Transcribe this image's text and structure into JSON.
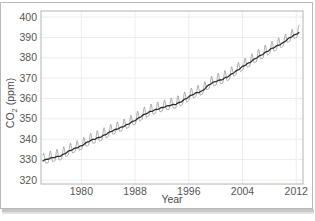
{
  "figure": {
    "background_color": "#ffffff",
    "border_color": "#b9b9b9",
    "plot_border_color": "#b4b4b4",
    "grid_color": "#ededed"
  },
  "chart_data": {
    "type": "line",
    "title": "",
    "xlabel": "Year",
    "ylabel": "CO2 (ppm)",
    "ylabel_main": "CO",
    "ylabel_sub": "2",
    "ylabel_unit": " (ppm)",
    "xlim": [
      1974.0,
      2013.0
    ],
    "ylim": [
      318.0,
      403.0
    ],
    "xticks": [
      1980,
      1988,
      1996,
      2004,
      2012
    ],
    "xtick_labels": [
      "1980",
      "1988",
      "1996",
      "2004",
      "2012"
    ],
    "yticks": [
      320,
      330,
      340,
      350,
      360,
      370,
      380,
      390,
      400
    ],
    "ytick_labels": [
      "320",
      "330",
      "340",
      "350",
      "360",
      "370",
      "380",
      "390",
      "400"
    ],
    "grid": true,
    "legend": "none",
    "series": [
      {
        "name": "Monthly mean CO2",
        "color": "#8c8c8c",
        "linewidth": 0.7,
        "description": "Monthly average atmospheric CO2 at Mauna Loa showing seasonal sawtooth oscillation of about +/- 3.2 ppm superimposed on rising trend",
        "seasonal_amplitude_ppm": 3.2,
        "seasonal_peak_month": 5,
        "seasonal_trough_month": 10
      },
      {
        "name": "Trend (seasonally adjusted)",
        "color": "#2b2b2b",
        "linewidth": 1.3,
        "description": "Smoothed long term trend rising from about 330 ppm in 1975 to about 390 ppm in 2012",
        "annual_anchors": [
          {
            "year": 1974.3,
            "value": 329.6
          },
          {
            "year": 1975.0,
            "value": 330.2
          },
          {
            "year": 1976.0,
            "value": 331.1
          },
          {
            "year": 1977.0,
            "value": 332.0
          },
          {
            "year": 1978.0,
            "value": 333.8
          },
          {
            "year": 1979.0,
            "value": 335.4
          },
          {
            "year": 1980.0,
            "value": 336.8
          },
          {
            "year": 1981.0,
            "value": 338.7
          },
          {
            "year": 1982.0,
            "value": 340.1
          },
          {
            "year": 1983.0,
            "value": 341.4
          },
          {
            "year": 1984.0,
            "value": 343.0
          },
          {
            "year": 1985.0,
            "value": 344.6
          },
          {
            "year": 1986.0,
            "value": 346.0
          },
          {
            "year": 1987.0,
            "value": 347.4
          },
          {
            "year": 1988.0,
            "value": 349.2
          },
          {
            "year": 1989.0,
            "value": 351.6
          },
          {
            "year": 1990.0,
            "value": 353.1
          },
          {
            "year": 1991.0,
            "value": 354.4
          },
          {
            "year": 1992.0,
            "value": 355.6
          },
          {
            "year": 1993.0,
            "value": 356.4
          },
          {
            "year": 1994.0,
            "value": 357.1
          },
          {
            "year": 1995.0,
            "value": 358.8
          },
          {
            "year": 1996.0,
            "value": 360.8
          },
          {
            "year": 1997.0,
            "value": 362.6
          },
          {
            "year": 1998.0,
            "value": 363.8
          },
          {
            "year": 1999.0,
            "value": 366.7
          },
          {
            "year": 2000.0,
            "value": 368.4
          },
          {
            "year": 2001.0,
            "value": 369.5
          },
          {
            "year": 2002.0,
            "value": 371.1
          },
          {
            "year": 2003.0,
            "value": 373.3
          },
          {
            "year": 2004.0,
            "value": 375.8
          },
          {
            "year": 2005.0,
            "value": 377.5
          },
          {
            "year": 2006.0,
            "value": 379.8
          },
          {
            "year": 2007.0,
            "value": 381.9
          },
          {
            "year": 2008.0,
            "value": 383.8
          },
          {
            "year": 2009.0,
            "value": 385.6
          },
          {
            "year": 2010.0,
            "value": 387.4
          },
          {
            "year": 2011.0,
            "value": 389.8
          },
          {
            "year": 2012.0,
            "value": 391.6
          },
          {
            "year": 2012.4,
            "value": 392.5
          }
        ]
      }
    ]
  }
}
